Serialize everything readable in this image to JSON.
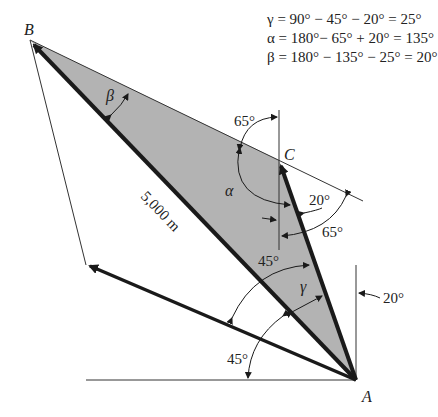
{
  "equations": [
    "γ = 90° − 45° − 20° = 25°",
    "α = 180°− 65° + 20° = 135°",
    "β = 180° − 135° − 25° = 20°"
  ],
  "points": {
    "A": {
      "label": "A",
      "x": 356,
      "y": 380
    },
    "B": {
      "label": "B",
      "x": 30,
      "y": 40
    },
    "C": {
      "label": "C",
      "x": 279,
      "y": 160
    },
    "D": {
      "x": 86,
      "y": 265
    }
  },
  "labels": {
    "distance": "5,000 m",
    "alpha": "α",
    "beta": "β",
    "gamma": "γ",
    "angle_65_top": "65°",
    "angle_20_right": "20°",
    "angle_65_right": "65°",
    "angle_45_mid": "45°",
    "angle_45_bottom": "45°",
    "angle_20_A": "20°"
  },
  "colors": {
    "triangle_fill": "#b3b3b3",
    "stroke": "#1a1a1a"
  }
}
